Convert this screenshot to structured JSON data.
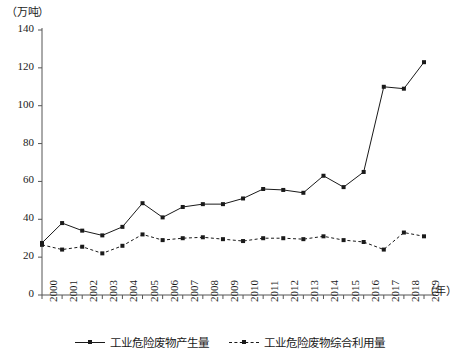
{
  "chart_data": {
    "type": "line",
    "title": "",
    "xlabel": "（年）",
    "ylabel": "（万吨）",
    "x": [
      2000,
      2001,
      2002,
      2003,
      2004,
      2005,
      2006,
      2007,
      2008,
      2009,
      2010,
      2011,
      2012,
      2013,
      2014,
      2015,
      2016,
      2017,
      2018,
      2019
    ],
    "categories": [
      "2000",
      "2001",
      "2002",
      "2003",
      "2004",
      "2005",
      "2006",
      "2007",
      "2008",
      "2009",
      "2010",
      "2011",
      "2012",
      "2013",
      "2014",
      "2015",
      "2016",
      "2017",
      "2018",
      "2019"
    ],
    "ylim": [
      0,
      140
    ],
    "yticks": [
      0,
      20,
      40,
      60,
      80,
      100,
      120,
      140
    ],
    "grid": false,
    "legend_position": "bottom",
    "series": [
      {
        "name": "工业危险废物产生量",
        "style": "solid",
        "marker": "square",
        "color": "#1a1a1a",
        "values": [
          27.5,
          38,
          34,
          31.5,
          36,
          48.5,
          41,
          46.5,
          48,
          48,
          51,
          56,
          55.5,
          54,
          63,
          57,
          65,
          110,
          109,
          123
        ]
      },
      {
        "name": "工业危险废物综合利用量",
        "style": "dashed",
        "marker": "square",
        "color": "#1a1a1a",
        "values": [
          26.5,
          24,
          25.5,
          22,
          26,
          32,
          29,
          30,
          30.5,
          29.5,
          28.5,
          30,
          30,
          29.5,
          31,
          29,
          28,
          24,
          33,
          31
        ]
      }
    ]
  },
  "legend": {
    "entries": [
      {
        "label": "工业危险废物产生量",
        "style": "solid"
      },
      {
        "label": "工业危险废物综合利用量",
        "style": "dashed"
      }
    ]
  }
}
